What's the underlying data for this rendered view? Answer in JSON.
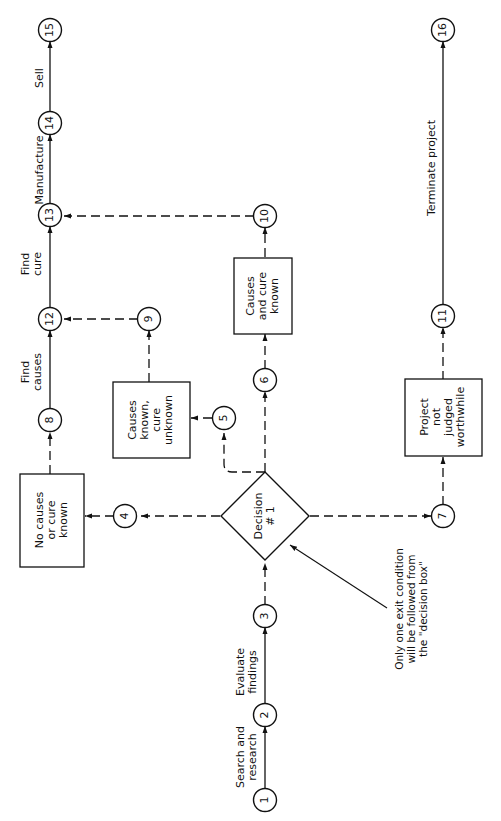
{
  "header": {
    "partial_text": ""
  },
  "nodes": [
    {
      "id": "1",
      "label": "1"
    },
    {
      "id": "2",
      "label": "2"
    },
    {
      "id": "3",
      "label": "3"
    },
    {
      "id": "4",
      "label": "4"
    },
    {
      "id": "5",
      "label": "5"
    },
    {
      "id": "6",
      "label": "6"
    },
    {
      "id": "7",
      "label": "7"
    },
    {
      "id": "8",
      "label": "8"
    },
    {
      "id": "9",
      "label": "9"
    },
    {
      "id": "10",
      "label": "10"
    },
    {
      "id": "11",
      "label": "11"
    },
    {
      "id": "12",
      "label": "12"
    },
    {
      "id": "13",
      "label": "13"
    },
    {
      "id": "14",
      "label": "14"
    },
    {
      "id": "15",
      "label": "15"
    },
    {
      "id": "16",
      "label": "16"
    }
  ],
  "activities": {
    "search_research": "Search and\nresearch",
    "evaluate_findings": "Evaluate\nfindings",
    "find_causes": "Find\ncauses",
    "find_cure": "Find\ncure",
    "manufacture": "Manufacture",
    "sell": "Sell",
    "terminate_project": "Terminate project"
  },
  "boxes": {
    "no_causes": "No causes\nor cure\nknown",
    "causes_known_cure_unknown": "Causes\nknown,\ncure\nunknown",
    "causes_and_cure_known": "Causes\nand cure\nknown",
    "project_not_worthwhile": "Project\nnot\njudged\nworthwhile"
  },
  "decision": {
    "label": "Decision\n# 1"
  },
  "annotation": {
    "text": "Only one exit condition\nwill be followed from\nthe \"decision box\""
  }
}
